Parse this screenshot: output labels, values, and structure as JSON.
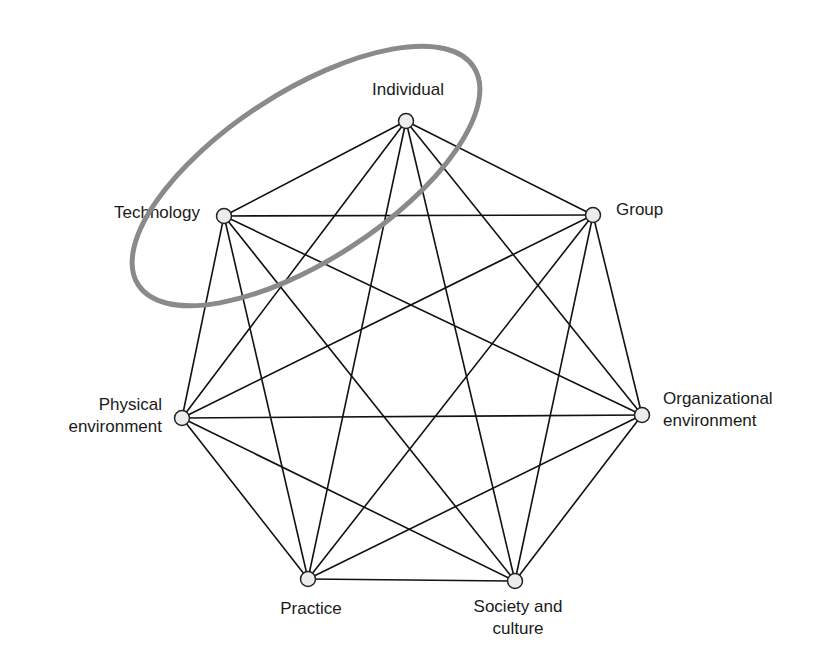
{
  "diagram": {
    "type": "complete-graph",
    "nodes": [
      {
        "id": "individual",
        "label_lines": [
          "Individual"
        ]
      },
      {
        "id": "group",
        "label_lines": [
          "Group"
        ]
      },
      {
        "id": "organizational-environment",
        "label_lines": [
          "Organizational",
          "environment"
        ]
      },
      {
        "id": "society-and-culture",
        "label_lines": [
          "Society and",
          "culture"
        ]
      },
      {
        "id": "practice",
        "label_lines": [
          "Practice"
        ]
      },
      {
        "id": "physical-environment",
        "label_lines": [
          "Physical",
          "environment"
        ]
      },
      {
        "id": "technology",
        "label_lines": [
          "Technology"
        ]
      }
    ],
    "edges": "all-pairs",
    "highlight": {
      "nodes": [
        "individual",
        "technology"
      ],
      "shape": "ellipse",
      "color": "#8a8a8a"
    },
    "colors": {
      "edge": "#111111",
      "node_fill": "#ececec",
      "node_stroke": "#222222"
    }
  }
}
